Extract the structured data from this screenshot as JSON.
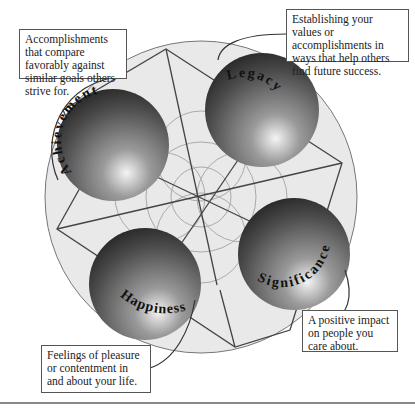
{
  "diagram": {
    "type": "four-sphere success model",
    "spheres": [
      {
        "id": "achievement",
        "label": "Achievement",
        "description": "Accomplishments that compare favorably against similar goals others strive for."
      },
      {
        "id": "legacy",
        "label": "Legacy",
        "description": "Establishing your values or accomplishments in ways that help others find future success."
      },
      {
        "id": "significance",
        "label": "Significance",
        "description": "A positive impact on people you care about."
      },
      {
        "id": "happiness",
        "label": "Happiness",
        "description": "Feelings of pleasure or contentment in and about your life."
      }
    ],
    "colors": {
      "outer_circle": "#e8e8e8",
      "lines": "#444444",
      "sphere_dark": "#2a2a2a",
      "sphere_light": "#f2f2f2"
    }
  }
}
